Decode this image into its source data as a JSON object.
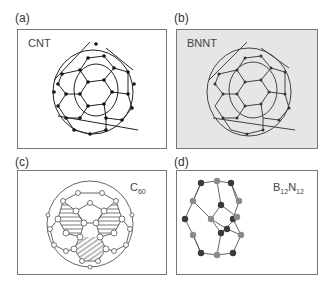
{
  "figure": {
    "panels": [
      {
        "id": "a",
        "label": "(a)",
        "title": "CNT",
        "type": "carbon-nanotube",
        "background": "#ffffff",
        "bond_color": "#222222",
        "atom_color": "#111111"
      },
      {
        "id": "b",
        "label": "(b)",
        "title": "BNNT",
        "type": "boron-nitride-nanotube",
        "background": "#e6e6e6",
        "bond_color": "#444444",
        "atom_color": "#333333"
      },
      {
        "id": "c",
        "label": "(c)",
        "title_main": "C",
        "title_sub": "60",
        "type": "fullerene-c60",
        "background": "#ffffff",
        "atom_color": "#ffffff"
      },
      {
        "id": "d",
        "label": "(d)",
        "title_b": "B",
        "title_b_sub": "12",
        "title_n": "N",
        "title_n_sub": "12",
        "type": "b12n12-cage",
        "background": "#ffffff",
        "atom_dark": "#3a3a3a",
        "atom_light": "#8a8a8a"
      }
    ]
  }
}
